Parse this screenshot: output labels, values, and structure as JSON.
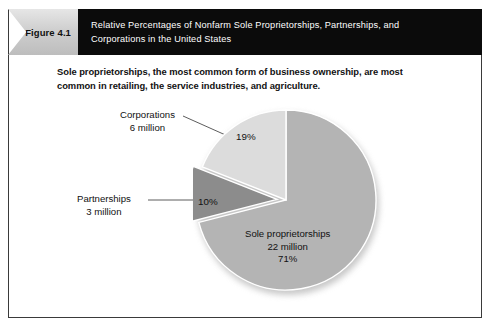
{
  "figure": {
    "label": "Figure 4.1",
    "title_line_1": "Relative Percentages of Nonfarm Sole Proprietorships, Partnerships, and",
    "title_line_2": "Corporations in the United States",
    "subtitle_line_1": "Sole proprietorships, the most common form of business ownership, are most",
    "subtitle_line_2": "common in retailing, the service industries, and agriculture."
  },
  "labels": {
    "corporations_name": "Corporations",
    "corporations_count": "6 million",
    "corporations_pct": "19%",
    "partnerships_name": "Partnerships",
    "partnerships_count": "3 million",
    "partnerships_pct": "10%",
    "sole_name": "Sole proprietorships",
    "sole_count": "22 million",
    "sole_pct": "71%"
  },
  "colors": {
    "sole": "#b4b4b4",
    "partnerships": "#8c8c8c",
    "corporations": "#dcdcdc",
    "header_bar": "#0b0b0b",
    "label_tab": "#cfcfcf",
    "frame_border": "#3a3a3a"
  },
  "chart_data": {
    "type": "pie",
    "title": "Relative Percentages of Nonfarm Sole Proprietorships, Partnerships, and Corporations in the United States",
    "subtitle": "Sole proprietorships, the most common form of business ownership, are most common in retailing, the service industries, and agriculture.",
    "categories": [
      "Sole proprietorships",
      "Partnerships",
      "Corporations"
    ],
    "values": [
      71,
      10,
      19
    ],
    "value_unit": "percent",
    "counts": [
      22,
      3,
      6
    ],
    "counts_unit": "million",
    "data_labels": [
      "71%",
      "10%",
      "19%"
    ],
    "slice_colors": [
      "#b4b4b4",
      "#8c8c8c",
      "#dcdcdc"
    ],
    "exploded_slices": [
      "Partnerships"
    ],
    "start_angle_deg": 0,
    "direction": "clockwise",
    "legend": "none",
    "grid": false
  }
}
